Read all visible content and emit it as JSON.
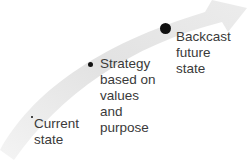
{
  "diagram": {
    "type": "curved-arrow-progression",
    "arrow_color": "#e4e4e4",
    "stages": [
      {
        "label_lines": [
          "Current",
          "state"
        ],
        "marker_size": "small"
      },
      {
        "label_lines": [
          "Strategy",
          "based on",
          "values",
          "and",
          "purpose"
        ],
        "marker_size": "medium"
      },
      {
        "label_lines": [
          "Backcast",
          "future",
          "state"
        ],
        "marker_size": "large"
      }
    ]
  }
}
